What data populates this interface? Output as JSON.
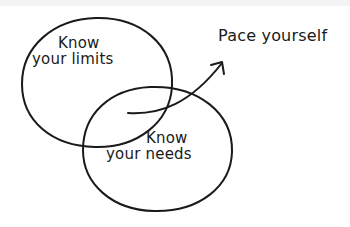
{
  "diagram": {
    "type": "venn",
    "style": "hand-drawn",
    "colors": {
      "ink": "#1a1a1a",
      "background": "#ffffff"
    },
    "circles": [
      {
        "id": "limits",
        "label_line1": "Know",
        "label_line2": "your limits",
        "cx": 97,
        "cy": 83,
        "rx": 75,
        "ry": 65
      },
      {
        "id": "needs",
        "label_line1": "Know",
        "label_line2": "your needs",
        "cx": 158,
        "cy": 149,
        "rx": 75,
        "ry": 62
      }
    ],
    "intersection_annotation": {
      "text": "Pace yourself",
      "arrow_from": [
        128,
        113
      ],
      "arrow_to": [
        222,
        62
      ]
    }
  }
}
